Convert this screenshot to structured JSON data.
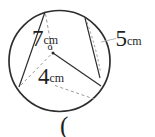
{
  "figure": {
    "type": "geometry-circle-diagram",
    "background": "#ffffff",
    "stroke_color": "#2e2e2e",
    "dash_color": "#8f8f8f",
    "leader_color": "#b3b3b3",
    "text_color": "#1f1f1f",
    "center_label": "o",
    "labels": {
      "chord_left": {
        "value": "7",
        "unit": "cm"
      },
      "chord_right": {
        "value": "5",
        "unit": "cm"
      },
      "radius": {
        "value": "4",
        "unit": "cm"
      }
    },
    "answer_prompt": "("
  }
}
